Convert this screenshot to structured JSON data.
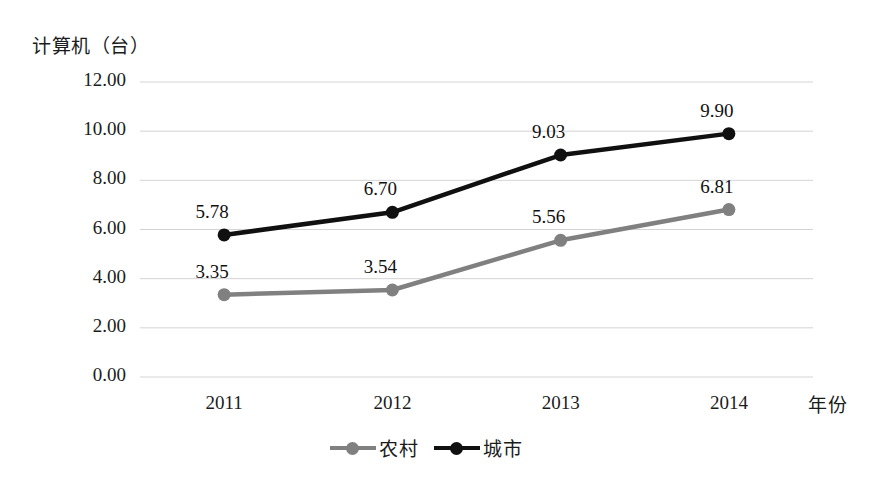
{
  "chart_data": {
    "type": "line",
    "title": "",
    "xlabel": "年份",
    "ylabel": "计算机（台）",
    "categories": [
      "2011",
      "2012",
      "2013",
      "2014"
    ],
    "ylim": [
      0,
      12
    ],
    "ytick_step": 2,
    "ytick_labels": [
      "12.00",
      "10.00",
      "8.00",
      "6.00",
      "4.00",
      "2.00",
      "0.00"
    ],
    "ytick_values": [
      12,
      10,
      8,
      6,
      4,
      2,
      0
    ],
    "grid": true,
    "grid_axis": "y",
    "legend_position": "bottom",
    "series": [
      {
        "name": "农村",
        "color": "#808080",
        "values": [
          3.35,
          3.54,
          5.56,
          6.81
        ],
        "labels": [
          "3.35",
          "3.54",
          "5.56",
          "6.81"
        ]
      },
      {
        "name": "城市",
        "color": "#101010",
        "values": [
          5.78,
          6.7,
          9.03,
          9.9
        ],
        "labels": [
          "5.78",
          "6.70",
          "9.03",
          "9.90"
        ]
      }
    ]
  },
  "legend": {
    "items": [
      {
        "label": "农村"
      },
      {
        "label": "城市"
      }
    ]
  },
  "colors": {
    "rural": "#808080",
    "urban": "#101010",
    "grid": "#d4d4d4",
    "text": "#1b1b1b"
  }
}
